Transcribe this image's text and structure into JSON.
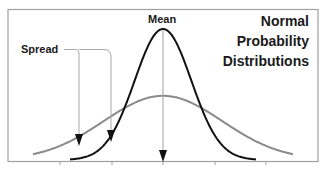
{
  "chart_data": {
    "type": "line",
    "title_lines": [
      "Normal",
      "Probability",
      "Distributions"
    ],
    "xlabel": "",
    "ylabel": "",
    "grid": false,
    "legend": null,
    "x_ticks": [
      -2,
      -1,
      0,
      1,
      2
    ],
    "x_tick_labels": [],
    "xlim": [
      -3,
      3
    ],
    "series": [
      {
        "name": "Narrow distribution (small spread)",
        "color": "#111111",
        "mean": 0,
        "sd": 0.55,
        "peak_relative": 1.0
      },
      {
        "name": "Wide distribution (large spread)",
        "color": "#8a8a8a",
        "mean": 0,
        "sd": 1.15,
        "peak_relative": 0.49
      }
    ],
    "annotations": [
      {
        "label": "Mean",
        "type": "arrow",
        "target_x": 0
      },
      {
        "label": "Spread",
        "type": "bracket-arrows",
        "targets": [
          "wide curve left flank",
          "narrow curve left flank"
        ]
      }
    ]
  },
  "labels": {
    "title_line_1": "Normal",
    "title_line_2": "Probability",
    "title_line_3": "Distributions",
    "mean": "Mean",
    "spread": "Spread"
  },
  "colors": {
    "narrow_curve": "#111111",
    "wide_curve": "#8a8a8a",
    "frame": "#9a9a9a",
    "arrow_line": "#9a9a9a",
    "arrow_head": "#111111",
    "text": "#1a1a1a"
  }
}
